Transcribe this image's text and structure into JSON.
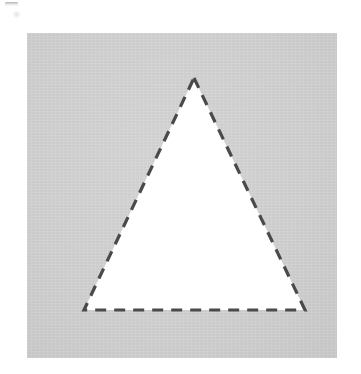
{
  "figure": {
    "canvas": {
      "width": 361,
      "height": 374,
      "background_color": "#ffffff"
    },
    "panel": {
      "label": "image-panel",
      "x": 27,
      "y": 33,
      "width": 310,
      "height": 325,
      "fill_color": "#cccccc",
      "texture": "scanned-paper-grain"
    },
    "corner_artifact": {
      "label": "scan-edge-mark",
      "x": 5,
      "y": 2,
      "width": 13,
      "height": 4,
      "color": "#787878"
    }
  },
  "chart_data": {
    "type": "diagram",
    "title": "",
    "subtitle": "",
    "xlabel": "",
    "ylabel": "",
    "grid": false,
    "legend": null,
    "annotations": [],
    "shapes": [
      {
        "name": "triangle",
        "kind": "polygon",
        "sides": 3,
        "description": "isosceles triangle outlined with a dashed stroke on a light gray field",
        "fill_color": "#ffffff",
        "stroke_color": "#4a4a4a",
        "stroke_width": 3.2,
        "stroke_style": "dashed",
        "dash_length": 11,
        "dash_gap": 8,
        "vertices_panel_coords": [
          {
            "name": "apex",
            "x": 167,
            "y": 45
          },
          {
            "name": "bottom-right",
            "x": 278,
            "y": 277
          },
          {
            "name": "bottom-left",
            "x": 57,
            "y": 277
          }
        ],
        "vertices_image_coords": [
          {
            "name": "apex",
            "x": 194,
            "y": 78
          },
          {
            "name": "bottom-right",
            "x": 305,
            "y": 310
          },
          {
            "name": "bottom-left",
            "x": 84,
            "y": 310
          }
        ],
        "base_length_px": 221,
        "height_px": 232
      }
    ]
  }
}
